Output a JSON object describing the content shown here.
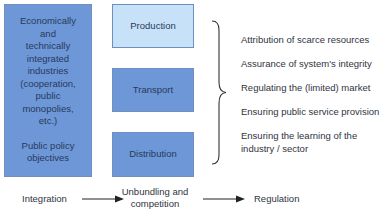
{
  "left_box": {
    "lines": [
      "Economically",
      "and",
      "technically",
      "integrated",
      "industries",
      "(cooperation,",
      "public",
      "monopolies,",
      "etc.)"
    ],
    "footer_lines": [
      "Public policy",
      "objectives"
    ]
  },
  "value_chain": {
    "production": "Production",
    "transport": "Transport",
    "distribution": "Distribution"
  },
  "regulation_tasks": [
    "Attribution of scarce resources",
    "Assurance of system's integrity",
    "Regulating the (limited) market",
    "Ensuring public service provision",
    "Ensuring the learning of the",
    "industry / sector"
  ],
  "flow": {
    "stage1": "Integration",
    "stage2_line1": "Unbundling and",
    "stage2_line2": "competition",
    "stage3": "Regulation"
  },
  "colors": {
    "dark_box": "#6d97d6",
    "light_box": "#c7e1f8",
    "border": "#6f8fc0"
  }
}
